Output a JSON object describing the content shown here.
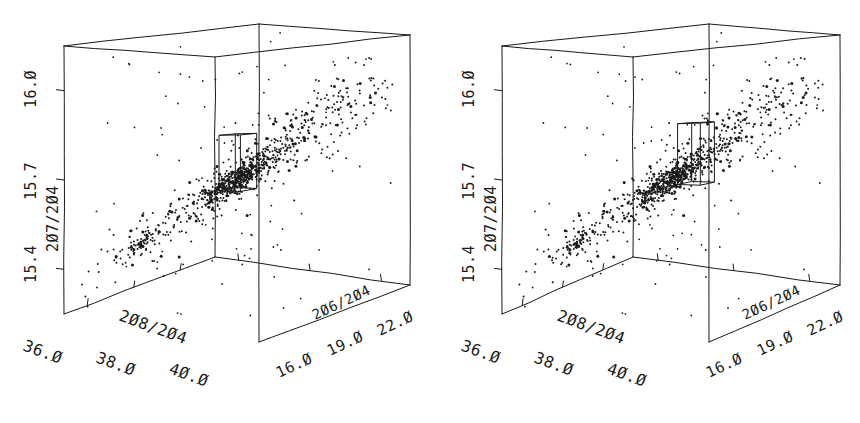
{
  "figure": {
    "title": "",
    "panel_count": 2,
    "background_color": "#ffffff",
    "ink_color": "#1a1a1a"
  },
  "chart_data": [
    {
      "id": "panel-left",
      "type": "scatter",
      "projection": "3d",
      "title": "",
      "xlabel": "208/204",
      "ylabel": "207/204",
      "zlabel": "206/204",
      "xticklabels": [
        "36.0",
        "38.0",
        "40.0"
      ],
      "xtickvalues": [
        36.0,
        38.0,
        40.0
      ],
      "yticklabels": [
        "15.4",
        "15.7",
        "16.0"
      ],
      "ytickvalues": [
        15.4,
        15.7,
        16.0
      ],
      "zticklabels": [
        "16.0",
        "19.0",
        "22.0"
      ],
      "ztickvalues": [
        16.0,
        19.0,
        22.0
      ],
      "xlim": [
        35.0,
        41.5
      ],
      "ylim": [
        15.25,
        16.15
      ],
      "zlim": [
        15.0,
        23.2
      ],
      "grid": false,
      "legend": false,
      "marker": "point",
      "marker_size": 1.4,
      "n_points": 900,
      "selection_box": {
        "label": "selection-box",
        "x": [
          38.55,
          39.25
        ],
        "y": [
          15.62,
          15.82
        ],
        "z": [
          18.05,
          18.95
        ]
      },
      "clusters": [
        {
          "name": "main-ridge",
          "cx": 38.8,
          "cy": 15.68,
          "cz": 18.4,
          "weight": 0.42
        },
        {
          "name": "lower-left-tail",
          "cx": 36.6,
          "cy": 15.44,
          "cz": 16.4,
          "weight": 0.16
        },
        {
          "name": "upper-right-diffuse",
          "cx": 40.2,
          "cy": 15.93,
          "cz": 20.9,
          "weight": 0.24
        },
        {
          "name": "background-scatter",
          "cx": 38.3,
          "cy": 15.66,
          "cz": 18.6,
          "weight": 0.18
        }
      ]
    },
    {
      "id": "panel-right",
      "type": "scatter",
      "projection": "3d",
      "title": "",
      "xlabel": "208/204",
      "ylabel": "207/204",
      "zlabel": "206/204",
      "xticklabels": [
        "36.0",
        "38.0",
        "40.0"
      ],
      "xtickvalues": [
        36.0,
        38.0,
        40.0
      ],
      "yticklabels": [
        "15.4",
        "15.7",
        "16.0"
      ],
      "ytickvalues": [
        15.4,
        15.7,
        16.0
      ],
      "zticklabels": [
        "16.0",
        "19.0",
        "22.0"
      ],
      "ztickvalues": [
        16.0,
        19.0,
        22.0
      ],
      "xlim": [
        35.0,
        41.5
      ],
      "ylim": [
        15.25,
        16.15
      ],
      "zlim": [
        15.0,
        23.2
      ],
      "grid": false,
      "legend": false,
      "marker": "point",
      "marker_size": 1.4,
      "n_points": 900,
      "selection_box": {
        "label": "selection-box",
        "x": [
          38.75,
          39.45
        ],
        "y": [
          15.64,
          15.86
        ],
        "z": [
          18.25,
          19.15
        ]
      },
      "clusters": [
        {
          "name": "main-ridge",
          "cx": 38.8,
          "cy": 15.68,
          "cz": 18.4,
          "weight": 0.42
        },
        {
          "name": "lower-left-tail",
          "cx": 36.6,
          "cy": 15.44,
          "cz": 16.4,
          "weight": 0.16
        },
        {
          "name": "upper-right-diffuse",
          "cx": 40.2,
          "cy": 15.93,
          "cz": 20.9,
          "weight": 0.24
        },
        {
          "name": "background-scatter",
          "cx": 38.3,
          "cy": 15.66,
          "cz": 18.6,
          "weight": 0.18
        }
      ]
    }
  ]
}
